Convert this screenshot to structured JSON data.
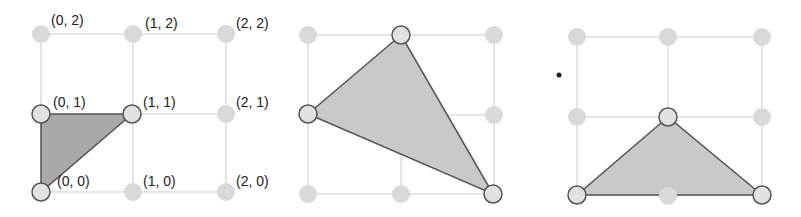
{
  "colors": {
    "grid_line": "#dcdcdc",
    "grid_dot": "#d9d9d9",
    "vertex_fill": "#e2e2e2",
    "vertex_stroke": "#555555",
    "triangle_stroke": "#555555",
    "triangle_fill_dark": "#a9a9a9",
    "triangle_fill_light": "#c9c9c9"
  },
  "panels": [
    {
      "id": "panel-1",
      "labels": [
        "(0, 2)",
        "(1, 2)",
        "(2, 2)",
        "(0, 1)",
        "(1, 1)",
        "(2, 1)",
        "(0, 0)",
        "(1, 0)",
        "(2, 0)"
      ],
      "triangle_vertices": [
        "(0, 1)",
        "(1, 1)",
        "(0, 0)"
      ]
    },
    {
      "id": "panel-2",
      "labels": [],
      "triangle_vertices": [
        "(1, 2)",
        "(0, 1)",
        "(2, 0)"
      ]
    },
    {
      "id": "panel-3",
      "labels": [],
      "triangle_vertices": [
        "(1, 1)",
        "(0, 0)",
        "(2, 0)"
      ]
    }
  ]
}
